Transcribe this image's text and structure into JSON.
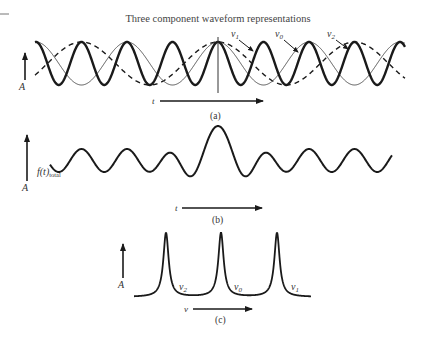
{
  "title": "Three component waveform representations",
  "panels": {
    "a": {
      "caption": "(a)",
      "y_axis_label": "A",
      "x_axis_label": "t",
      "labels": {
        "nu1": "ν",
        "nu1_sub": "1",
        "nu0": "ν",
        "nu0_sub": "0",
        "nu2": "ν",
        "nu2_sub": "2"
      },
      "components": [
        {
          "name": "ν1",
          "style": "thick solid",
          "relative_frequency": 3.0
        },
        {
          "name": "ν0",
          "style": "thin solid",
          "relative_frequency": 1.5
        },
        {
          "name": "ν2",
          "style": "dashed",
          "relative_frequency": 1.0
        }
      ]
    },
    "b": {
      "caption": "(b)",
      "y_axis_label": "A",
      "signal_label": "f(t)",
      "signal_sub": "total",
      "x_axis_label": "t"
    },
    "c": {
      "caption": "(c)",
      "y_axis_label": "A",
      "x_axis_label": "ν",
      "peaks": [
        {
          "label": "ν",
          "sub": "2"
        },
        {
          "label": "ν",
          "sub": "0"
        },
        {
          "label": "ν",
          "sub": "1"
        }
      ]
    }
  },
  "colors": {
    "ink": "#1a1a1a",
    "thin": "#555555",
    "paper": "#ffffff"
  }
}
